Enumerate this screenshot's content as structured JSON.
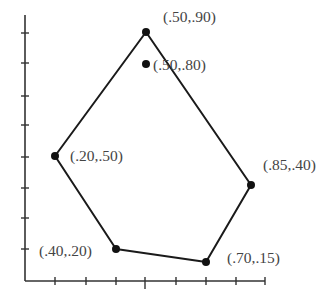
{
  "figure": {
    "type": "convex-hull-scatter",
    "stroke_color": "#1a1a1a",
    "label_color": "#444444",
    "axes": {
      "origin_px": [
        25,
        281
      ],
      "x_axis_end_px": 265,
      "y_axis_top_px": 15,
      "x_ticks_px": [
        55,
        86,
        116,
        145,
        176,
        206,
        236,
        265
      ],
      "x_major_tick_px": 145,
      "y_ticks_px": [
        33,
        63,
        96,
        125,
        157,
        188,
        218,
        249
      ]
    },
    "points": [
      {
        "id": "p1",
        "label": "(.50,.90)",
        "px": [
          146,
          32
        ],
        "label_px": [
          163,
          22
        ],
        "on_hull": true
      },
      {
        "id": "p2",
        "label": "(.50,.80)",
        "px": [
          146,
          64
        ],
        "label_px": [
          153,
          70
        ],
        "on_hull": false
      },
      {
        "id": "p3",
        "label": "(.20,.50)",
        "px": [
          55,
          156
        ],
        "label_px": [
          70,
          161
        ],
        "on_hull": true
      },
      {
        "id": "p4",
        "label": "(.85,.40)",
        "px": [
          251,
          185
        ],
        "label_px": [
          263,
          170
        ],
        "on_hull": true
      },
      {
        "id": "p5",
        "label": "(.40,.20)",
        "px": [
          116,
          249
        ],
        "label_px": [
          39,
          256
        ],
        "on_hull": true
      },
      {
        "id": "p6",
        "label": "(.70,.15)",
        "px": [
          206,
          262
        ],
        "label_px": [
          227,
          263
        ],
        "on_hull": true
      }
    ],
    "hull_order": [
      "p1",
      "p4",
      "p6",
      "p5",
      "p3",
      "p1"
    ]
  },
  "chart_data": {
    "type": "scatter",
    "title": "",
    "xlabel": "",
    "ylabel": "",
    "points": [
      {
        "x": 0.5,
        "y": 0.9,
        "label": "(.50,.90)"
      },
      {
        "x": 0.5,
        "y": 0.8,
        "label": "(.50,.80)"
      },
      {
        "x": 0.2,
        "y": 0.5,
        "label": "(.20,.50)"
      },
      {
        "x": 0.85,
        "y": 0.4,
        "label": "(.85,.40)"
      },
      {
        "x": 0.4,
        "y": 0.2,
        "label": "(.40,.20)"
      },
      {
        "x": 0.7,
        "y": 0.15,
        "label": "(.70,.15)"
      }
    ],
    "hull_polygon": [
      [
        0.5,
        0.9
      ],
      [
        0.85,
        0.4
      ],
      [
        0.7,
        0.15
      ],
      [
        0.4,
        0.2
      ],
      [
        0.2,
        0.5
      ]
    ],
    "grid": false,
    "legend": null
  }
}
